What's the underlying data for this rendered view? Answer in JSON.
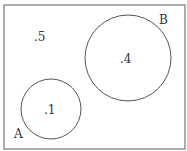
{
  "diagram": {
    "type": "venn",
    "universe": {
      "label": ".5",
      "x": 4,
      "y": 5,
      "width": 181,
      "height": 144
    },
    "sets": [
      {
        "name": "A",
        "value": ".1",
        "cx": 51,
        "cy": 109,
        "r": 30,
        "label_x": 14,
        "label_y": 138,
        "value_x": 44,
        "value_y": 114
      },
      {
        "name": "B",
        "value": ".4",
        "cx": 128,
        "cy": 58,
        "r": 43,
        "label_x": 159,
        "label_y": 24,
        "value_x": 120,
        "value_y": 63
      }
    ],
    "outside_value": {
      "text": ".5",
      "x": 34,
      "y": 41
    },
    "colors": {
      "stroke": "#555555",
      "border": "#777777",
      "text": "#333333"
    }
  }
}
